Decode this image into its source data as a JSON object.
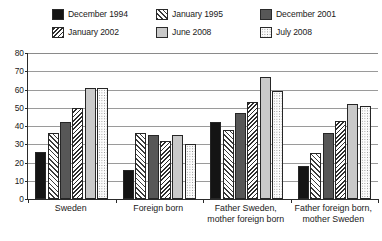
{
  "chart_data": {
    "type": "bar",
    "title": "",
    "subtitle": "",
    "xlabel": "",
    "ylabel": "",
    "ylim": [
      0,
      80
    ],
    "ytick_step": 10,
    "yticks": [
      "80",
      "70",
      "60",
      "50",
      "40",
      "30",
      "20",
      "10",
      "0"
    ],
    "grid": true,
    "legend_position": "top",
    "categories": [
      "Sweden",
      "Foreign born",
      "Father Sweden, mother foreign born",
      "Father foreign born, mother Sweden"
    ],
    "series": [
      {
        "name": "December 1994",
        "swatch": "s0",
        "values": [
          26,
          16,
          42,
          18
        ]
      },
      {
        "name": "January 1995",
        "swatch": "s1",
        "values": [
          36,
          36,
          38,
          25
        ]
      },
      {
        "name": "December 2001",
        "swatch": "s2",
        "values": [
          42,
          35,
          47,
          36
        ]
      },
      {
        "name": "January 2002",
        "swatch": "s3",
        "values": [
          50,
          32,
          53,
          43
        ]
      },
      {
        "name": "June 2008",
        "swatch": "s4",
        "values": [
          61,
          35,
          67,
          52
        ]
      },
      {
        "name": "July 2008",
        "swatch": "s5",
        "values": [
          61,
          30,
          59,
          51
        ]
      }
    ]
  },
  "colors": {
    "december_1994": "#141414",
    "december_2001": "#575757",
    "june_2008": "#c9c9c9",
    "axis": "#2a2a2a",
    "gridline": "#9a9a9a",
    "background": "#ffffff"
  }
}
